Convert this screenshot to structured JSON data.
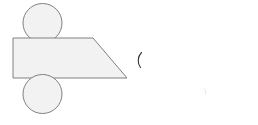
{
  "canvas": {
    "width": 258,
    "height": 125,
    "background_color": "#ffffff",
    "title": "Shape Diagram"
  },
  "style": {
    "shape_fill_color": "#f2f2f2",
    "shape_stroke_color": "#808080",
    "shape_stroke_width": 1,
    "glyph_stroke_color": "#333333",
    "faint_stroke_color": "#e8e8e8"
  },
  "shapes": [
    {
      "id": "top-circle",
      "type": "circle",
      "label": "Top circle",
      "cx": 42.5,
      "cy": 23,
      "r": 19.5,
      "fill": "#f2f2f2",
      "stroke": "#808080"
    },
    {
      "id": "trapezoid",
      "type": "trapezoid",
      "label": "Right trapezoid",
      "points": "13,38 93,38 127,78 13,78",
      "left": 13,
      "top": 38,
      "top_right_x": 93,
      "bottom_right_x": 127,
      "bottom": 78,
      "fill": "#f2f2f2",
      "stroke": "#808080"
    },
    {
      "id": "bottom-circle",
      "type": "circle",
      "label": "Bottom circle",
      "cx": 42.5,
      "cy": 94,
      "r": 19.5,
      "fill": "#f2f2f2",
      "stroke": "#808080"
    }
  ],
  "marks": [
    {
      "id": "paren-mark",
      "type": "arc",
      "label": "Open parenthesis mark",
      "path": "M 141.5 52.5 C 137.5 56.5 137.2 63.5 140.5 67.5",
      "stroke": "#333333"
    },
    {
      "id": "faint-mark",
      "type": "arc",
      "label": "Faint stray mark",
      "path": "M 204 88 C 205.5 90 206 92 205.5 94",
      "stroke": "#e8e8e8"
    }
  ]
}
